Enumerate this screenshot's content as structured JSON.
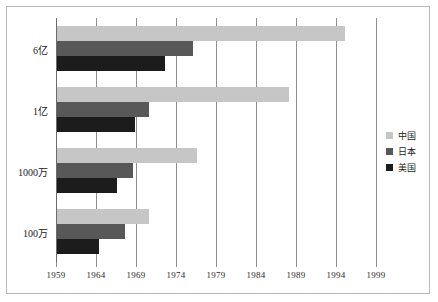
{
  "chart_data": {
    "type": "bar",
    "orientation": "horizontal",
    "title": "",
    "xlabel": "",
    "ylabel": "",
    "categories": [
      "6亿",
      "1亿",
      "1000万",
      "100万"
    ],
    "series": [
      {
        "name": "中国",
        "color": "#c6c6c6",
        "values": [
          1995.0,
          1988.0,
          1976.5,
          1970.5
        ]
      },
      {
        "name": "日本",
        "color": "#585858",
        "values": [
          1976.0,
          1970.5,
          1968.5,
          1967.5
        ]
      },
      {
        "name": "美国",
        "color": "#1c1c1c",
        "values": [
          1972.5,
          1968.7,
          1966.5,
          1964.3
        ]
      }
    ],
    "xlim": [
      1959,
      1999
    ],
    "xticks": [
      1959,
      1964,
      1969,
      1974,
      1979,
      1984,
      1989,
      1994,
      1999
    ],
    "xtick_labels": [
      "1959",
      "1964",
      "1969",
      "1974",
      "1979",
      "1984",
      "1989",
      "1994",
      "1999"
    ],
    "grid": true,
    "grid_axis": "x",
    "legend_position": "right",
    "legend": [
      "中国",
      "日本",
      "美国"
    ]
  },
  "colors": {
    "series_china": "#c6c6c6",
    "series_japan": "#585858",
    "series_usa": "#1c1c1c",
    "gridline": "#8f8f8f",
    "frame": "#b9b9b9",
    "text": "#1c1c1c",
    "background": "#ffffff"
  }
}
